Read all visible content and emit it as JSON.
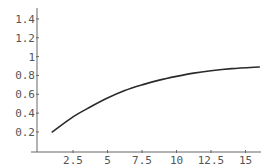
{
  "chart_data": {
    "type": "line",
    "title": "",
    "xlabel": "",
    "ylabel": "",
    "xlim": [
      0,
      16.3
    ],
    "ylim": [
      0,
      1.5
    ],
    "grid": false,
    "legend": null,
    "x_ticks": [
      2.5,
      5,
      7.5,
      10,
      12.5,
      15
    ],
    "x_tick_labels": [
      "2.5",
      "5",
      "7.5",
      "10",
      "12.5",
      "15"
    ],
    "y_ticks": [
      0.2,
      0.4,
      0.6,
      0.8,
      1,
      1.2,
      1.4
    ],
    "y_tick_labels": [
      "0.2",
      "0.4",
      "0.6",
      "0.8",
      "1",
      "1.2",
      "1.4"
    ],
    "series": [
      {
        "name": "curve",
        "color": "#2a2a2a",
        "x": [
          1,
          2.5,
          3.75,
          5,
          6.25,
          7.5,
          8.75,
          10,
          11.25,
          12.5,
          14,
          16
        ],
        "y": [
          0.2,
          0.36,
          0.465,
          0.56,
          0.64,
          0.7,
          0.75,
          0.79,
          0.825,
          0.85,
          0.872,
          0.89
        ]
      }
    ]
  },
  "layout": {
    "origin_px": [
      38.5,
      150.8
    ],
    "x_px_per_unit": 13.8,
    "y_px_per_unit": 94.2,
    "axis_color": "#666666",
    "label_color": "#555555"
  }
}
